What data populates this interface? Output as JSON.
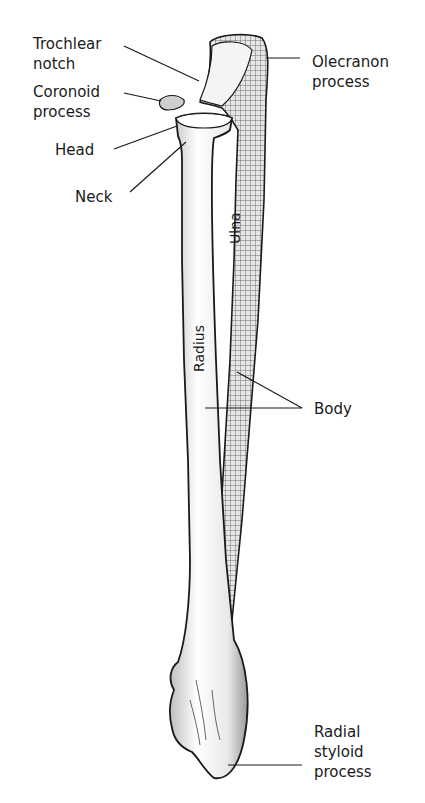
{
  "diagram": {
    "labels": {
      "trochlear_notch": "Trochlear\nnotch",
      "coronoid_process": "Coronoid\nprocess",
      "head": "Head",
      "neck": "Neck",
      "olecranon_process": "Olecranon\nprocess",
      "body": "Body",
      "radial_styloid_process": "Radial\nstyloid\nprocess",
      "ulna": "Ulna",
      "radius": "Radius"
    },
    "colors": {
      "line": "#1a1a1a",
      "bone_fill": "#f2f2f2",
      "bone_shade": "#9a9a9a",
      "background": "#ffffff"
    }
  }
}
